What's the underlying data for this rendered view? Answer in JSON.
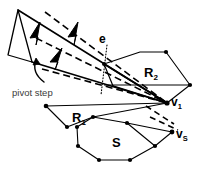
{
  "figure": {
    "background_color": "#ffffff",
    "stroke_color": "#000000",
    "width": 206,
    "height": 171,
    "labels": {
      "edge_e": "e",
      "region_R2_base": "R",
      "region_R2_sub": "2",
      "region_R1_base": "R",
      "region_R1_sub": "1",
      "polygon_S": "S",
      "vertex_v1_base": "v",
      "vertex_v1_sub": "1",
      "vertex_vS_base": "v",
      "vertex_vS_sub": "S",
      "pivot_step": "pivot step"
    },
    "elements": {
      "solid_polylines": "ray fan and region boundaries",
      "dashed_polylines": "pivoted ray positions",
      "dotted_line": "edge e extension",
      "arrow_count": 3,
      "curved_arrow": "pivot step indicator"
    }
  }
}
